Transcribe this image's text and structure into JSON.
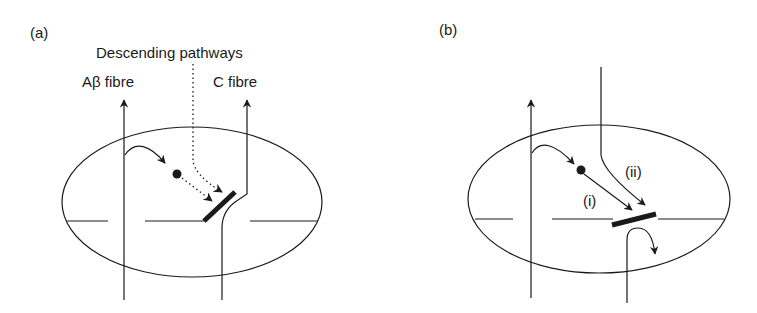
{
  "panels": [
    {
      "id": "a",
      "label": "(a)",
      "descending_label": "Descending pathways",
      "abeta_label": "Aβ fibre",
      "c_label": "C fibre"
    },
    {
      "id": "b",
      "label": "(b)",
      "path_i_label": "(i)",
      "path_ii_label": "(ii)"
    }
  ],
  "colors": {
    "ink": "#1a1a1a",
    "background": "#ffffff"
  }
}
